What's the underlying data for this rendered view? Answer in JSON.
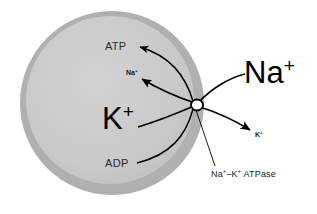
{
  "figure": {
    "background_color": "#ffffff",
    "cell": {
      "membrane_color": "#b0b0b0",
      "cytoplasm_color": "#c9c9c9",
      "center_x": 112,
      "center_y": 103,
      "outer_radius": 92,
      "membrane_thickness": 9
    },
    "pump": {
      "label": "pump-site",
      "x": 197,
      "y": 105,
      "rx": 6,
      "ry": 5.5,
      "stroke_color": "#000000"
    }
  },
  "labels": {
    "atp": "ATP",
    "adp": "ADP",
    "sodium_inside": "Na",
    "sodium_inside_charge": "+",
    "potassium_inside": "K",
    "potassium_inside_charge": "+",
    "sodium_outside": "Na",
    "sodium_outside_charge": "+",
    "potassium_outside": "K",
    "potassium_outside_charge": "+",
    "caption_part1": "Na",
    "caption_charge1": "+",
    "caption_dash": "–K",
    "caption_charge2": "+",
    "caption_part2": " ATPase"
  },
  "colors": {
    "stroke": "#000000",
    "text": "#1a1a1a",
    "membrane": "#b0b0b0",
    "cytoplasm": "#c9c9c9",
    "background": "#ffffff"
  }
}
